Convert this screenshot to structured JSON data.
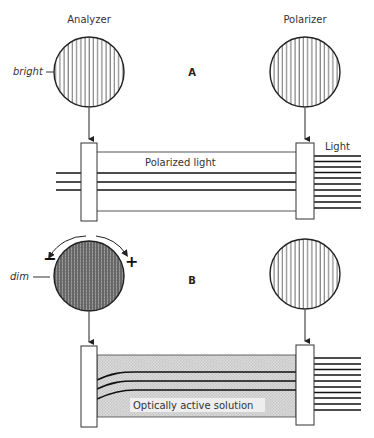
{
  "panel_a": {
    "label": "A",
    "analyzer_label": "Analyzer",
    "polarizer_label": "Polarizer",
    "analyzer_state": "bright",
    "beam_label": "Polarized light",
    "source_label": "Light"
  },
  "panel_b": {
    "label": "B",
    "analyzer_state": "dim",
    "rotation_minus": "−",
    "rotation_plus": "+",
    "solution_label": "Optically active solution"
  },
  "colors": {
    "line": "#222222",
    "shading": "#cfcfcf",
    "dark_hatch": "#555555"
  }
}
